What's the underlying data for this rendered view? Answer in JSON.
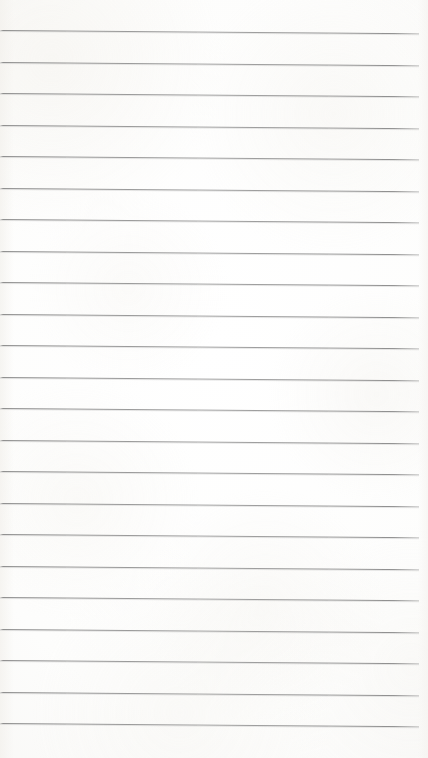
{
  "document": {
    "kind": "scanned-lined-paper",
    "title": "Lined Paper",
    "description": "Blank scanned sheet of ruled notebook paper",
    "width_px": 428,
    "height_px": 758,
    "text_content": "",
    "has_handwriting": false,
    "has_printed_text": false
  },
  "paper": {
    "background_color": "#fdfdfc",
    "highlight_color": "#ffffff",
    "edge_shade_color": "#f3f2ef",
    "texture_tint": "#eceae4"
  },
  "ruling": {
    "line_color": "#8e8e8e",
    "line_color_light": "#bebebe",
    "line_count": 23,
    "line_thickness_px": 1,
    "line_spacing_px": 31.5,
    "first_line_y_px": 30,
    "last_line_y_px": 723,
    "left_margin_px": 0,
    "right_margin_px": 9,
    "line_length_px": 419,
    "skew_px": 3.2,
    "skew_direction": "down-to-the-right",
    "lines": [
      {
        "index": 1,
        "y_px": 30.0,
        "label": "rule-line-1"
      },
      {
        "index": 2,
        "y_px": 61.5,
        "label": "rule-line-2"
      },
      {
        "index": 3,
        "y_px": 93.0,
        "label": "rule-line-3"
      },
      {
        "index": 4,
        "y_px": 124.5,
        "label": "rule-line-4"
      },
      {
        "index": 5,
        "y_px": 156.0,
        "label": "rule-line-5"
      },
      {
        "index": 6,
        "y_px": 187.5,
        "label": "rule-line-6"
      },
      {
        "index": 7,
        "y_px": 219.0,
        "label": "rule-line-7"
      },
      {
        "index": 8,
        "y_px": 250.5,
        "label": "rule-line-8"
      },
      {
        "index": 9,
        "y_px": 282.0,
        "label": "rule-line-9"
      },
      {
        "index": 10,
        "y_px": 313.5,
        "label": "rule-line-10"
      },
      {
        "index": 11,
        "y_px": 345.0,
        "label": "rule-line-11"
      },
      {
        "index": 12,
        "y_px": 376.5,
        "label": "rule-line-12"
      },
      {
        "index": 13,
        "y_px": 408.0,
        "label": "rule-line-13"
      },
      {
        "index": 14,
        "y_px": 439.5,
        "label": "rule-line-14"
      },
      {
        "index": 15,
        "y_px": 471.0,
        "label": "rule-line-15"
      },
      {
        "index": 16,
        "y_px": 502.5,
        "label": "rule-line-16"
      },
      {
        "index": 17,
        "y_px": 534.0,
        "label": "rule-line-17"
      },
      {
        "index": 18,
        "y_px": 565.5,
        "label": "rule-line-18"
      },
      {
        "index": 19,
        "y_px": 597.0,
        "label": "rule-line-19"
      },
      {
        "index": 20,
        "y_px": 628.5,
        "label": "rule-line-20"
      },
      {
        "index": 21,
        "y_px": 660.0,
        "label": "rule-line-21"
      },
      {
        "index": 22,
        "y_px": 691.5,
        "label": "rule-line-22"
      },
      {
        "index": 23,
        "y_px": 723.0,
        "label": "rule-line-23"
      }
    ]
  }
}
